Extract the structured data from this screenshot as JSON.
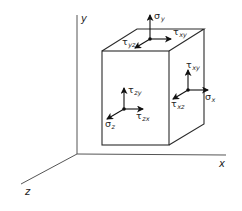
{
  "diagram": {
    "title": "",
    "type": "3D stress element",
    "axes": {
      "x": {
        "label": "x"
      },
      "y": {
        "label": "y"
      },
      "z": {
        "label": "z"
      }
    },
    "faces": {
      "top": {
        "normal": {
          "symbol": "σ",
          "subscript": "y"
        },
        "shear1": {
          "symbol": "τ",
          "subscript": "xy"
        },
        "shear2": {
          "symbol": "τ",
          "subscript": "yz"
        }
      },
      "front": {
        "normal": {
          "symbol": "σ",
          "subscript": "z"
        },
        "shear1": {
          "symbol": "τ",
          "subscript": "zy"
        },
        "shear2": {
          "symbol": "τ",
          "subscript": "zx"
        }
      },
      "right": {
        "normal": {
          "symbol": "σ",
          "subscript": "x"
        },
        "shear1": {
          "symbol": "τ",
          "subscript": "xy"
        },
        "shear2": {
          "symbol": "τ",
          "subscript": "xz"
        }
      }
    },
    "colors": {
      "lines": "#2a2a2a",
      "axes": "#555555",
      "background": "#ffffff"
    }
  }
}
